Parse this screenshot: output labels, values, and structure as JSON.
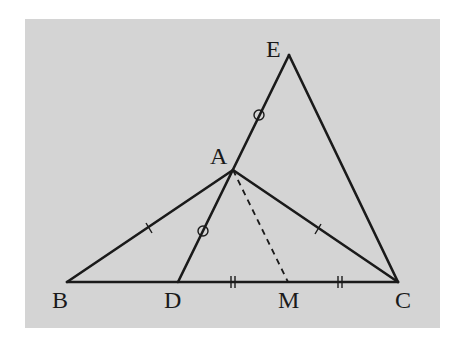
{
  "figure": {
    "background": "#d4d4d4",
    "line_color": "#1a1a1a",
    "panel": {
      "x": 25,
      "y": 19,
      "width": 415,
      "height": 309
    }
  },
  "points": {
    "A": {
      "label": "A",
      "x": 233,
      "y": 170,
      "label_x": 210,
      "label_y": 164
    },
    "B": {
      "label": "B",
      "x": 67,
      "y": 282,
      "label_x": 52,
      "label_y": 308
    },
    "C": {
      "label": "C",
      "x": 398,
      "y": 282,
      "label_x": 395,
      "label_y": 308
    },
    "D": {
      "label": "D",
      "x": 178,
      "y": 282,
      "label_x": 164,
      "label_y": 308
    },
    "E": {
      "label": "E",
      "x": 289,
      "y": 55,
      "label_x": 266,
      "label_y": 57
    },
    "M": {
      "label": "M",
      "x": 288,
      "y": 282,
      "label_x": 278,
      "label_y": 308
    }
  },
  "segments": [
    {
      "name": "segment-bc",
      "from": "B",
      "to": "C",
      "style": "solid"
    },
    {
      "name": "segment-ab",
      "from": "A",
      "to": "B",
      "style": "solid"
    },
    {
      "name": "segment-ac",
      "from": "A",
      "to": "C",
      "style": "solid"
    },
    {
      "name": "segment-de",
      "from": "D",
      "to": "E",
      "style": "solid"
    },
    {
      "name": "segment-ec",
      "from": "E",
      "to": "C",
      "style": "solid"
    },
    {
      "name": "segment-am",
      "from": "A",
      "to": "M",
      "style": "dashed"
    }
  ],
  "marks": {
    "single_ticks": [
      "AB",
      "AC"
    ],
    "circles": [
      "AE",
      "AD"
    ],
    "double_ticks": [
      "DM",
      "MC"
    ]
  }
}
